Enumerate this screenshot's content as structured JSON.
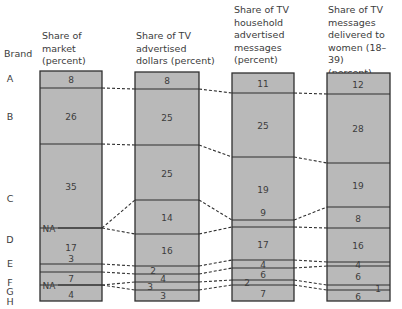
{
  "chart_data": {
    "type": "stacked-bar-comparison",
    "title": "",
    "row_label_header": "Brand",
    "brands": [
      "A",
      "B",
      "C",
      "D",
      "E",
      "F",
      "G",
      "H",
      "I"
    ],
    "columns": [
      {
        "header": [
          "Share of",
          "market",
          "(percent)"
        ],
        "values": {
          "A": 8,
          "B": 26,
          "C": 35,
          "D": "NA",
          "E": 17,
          "F": 3,
          "G": 7,
          "H": "NA",
          "I": 4
        },
        "labels": [
          "8",
          "26",
          "35",
          "NA",
          "17",
          "3",
          "7",
          "NA",
          "4"
        ]
      },
      {
        "header": [
          "Share of TV",
          "advertised",
          "dollars (percent)"
        ],
        "values": {
          "A": 8,
          "B": 25,
          "C": 25,
          "D": 14,
          "E": 16,
          "F": 2,
          "G": 4,
          "H": 3,
          "I": 3
        },
        "labels": [
          "8",
          "25",
          "25",
          "14",
          "16",
          "2",
          "4",
          "3",
          "3"
        ]
      },
      {
        "header": [
          "Share of TV",
          "household",
          "advertised",
          "messages",
          "(percent)"
        ],
        "values": {
          "A": 11,
          "B": 25,
          "C": 19,
          "D": 9,
          "E": 17,
          "F": 4,
          "G": 6,
          "H": 2,
          "I": 7
        },
        "labels": [
          "11",
          "25",
          "19",
          "9",
          "17",
          "4",
          "6",
          "2",
          "7"
        ]
      },
      {
        "header": [
          "Share of TV",
          "messages",
          "delivered to",
          "women (18–39)",
          "(percent)"
        ],
        "values": {
          "A": 12,
          "B": 28,
          "C": 19,
          "D": 8,
          "E": 16,
          "F": 4,
          "G": 6,
          "H": 1,
          "I": 6
        },
        "labels": [
          "12",
          "28",
          "19",
          "8",
          "16",
          "4",
          "6",
          "1",
          "6"
        ]
      }
    ],
    "colors": {
      "fill": "#b9b9b9",
      "line": "#2f2f2f",
      "text": "#3c3c3c"
    }
  }
}
